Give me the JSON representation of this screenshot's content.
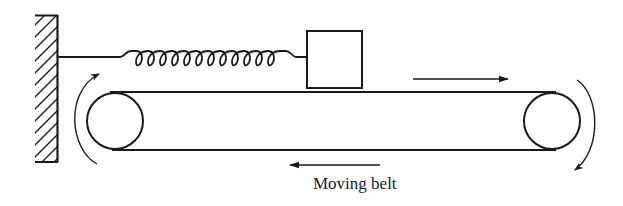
{
  "figure": {
    "type": "mechanical schematic",
    "caption": "Moving belt",
    "ink_color": "#1a1a1a",
    "background_color": "#ffffff"
  },
  "components": {
    "wall": {
      "label": "fixed-wall",
      "hatched": true
    },
    "spring": {
      "label": "spring",
      "coils": 12
    },
    "block": {
      "label": "mass-block"
    },
    "belt": {
      "label": "belt"
    },
    "pulleys": [
      {
        "label": "left-pulley",
        "rotation": "clockwise"
      },
      {
        "label": "right-pulley",
        "rotation": "clockwise"
      }
    ],
    "arrows": [
      {
        "label": "belt-top-direction",
        "direction": "right"
      },
      {
        "label": "belt-bottom-direction",
        "direction": "left"
      }
    ]
  }
}
